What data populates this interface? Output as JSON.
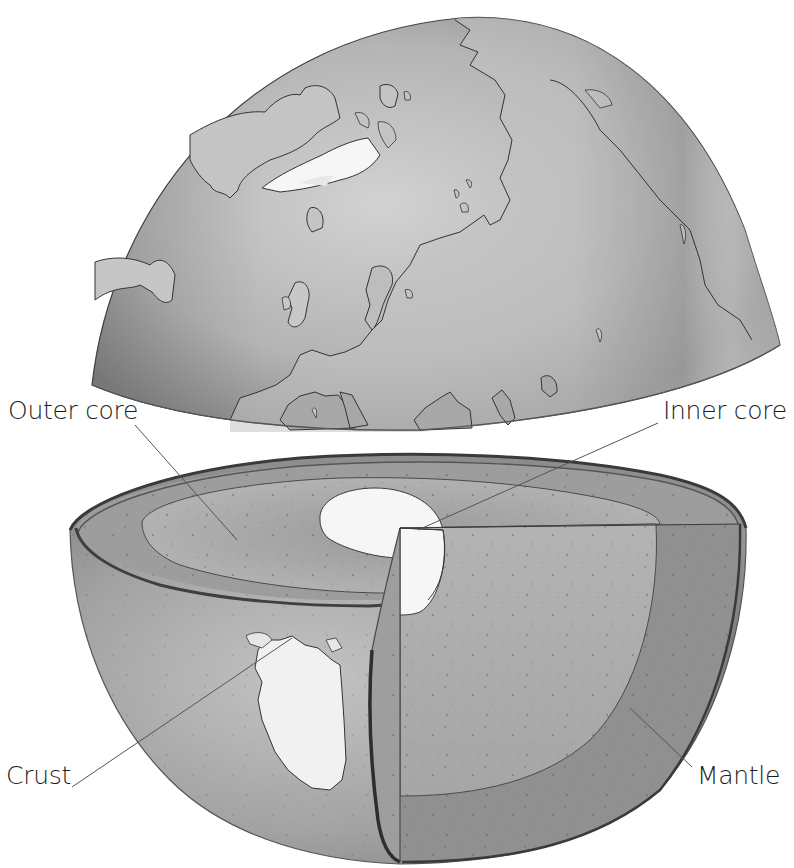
{
  "diagram": {
    "title_fragment": "",
    "colors": {
      "background": "#ffffff",
      "ocean": "#9a9a9a",
      "land": "#c9c9c9",
      "ice": "#f4f4f4",
      "outer_core": "#a8a8a8",
      "inner_core": "#f7f7f7",
      "mantle": "#8d8d8d",
      "crust": "#5a5a5a",
      "outline": "#333333",
      "leader_line": "#555555",
      "label_text": "#1c1c1c"
    },
    "components": [
      {
        "id": "upper-hemisphere",
        "description": "Northern hemisphere dome lifted off, showing Greenland, Europe, Scandinavia and Arctic landmasses"
      },
      {
        "id": "lower-hemisphere",
        "description": "Southern half cut open showing layered interior and Africa on the exterior"
      }
    ],
    "labels": [
      {
        "id": "outer-core",
        "text": "Outer core",
        "x": 8,
        "y": 398,
        "line": {
          "x1": 135,
          "y1": 425,
          "x2": 237,
          "y2": 540
        }
      },
      {
        "id": "inner-core",
        "text": "Inner core",
        "x": 663,
        "y": 398,
        "line": {
          "x1": 658,
          "y1": 423,
          "x2": 418,
          "y2": 530
        }
      },
      {
        "id": "crust",
        "text": "Crust",
        "x": 6,
        "y": 763,
        "line": {
          "x1": 72,
          "y1": 787,
          "x2": 292,
          "y2": 638
        }
      },
      {
        "id": "mantle",
        "text": "Mantle",
        "x": 697,
        "y": 763,
        "line": {
          "x1": 692,
          "y1": 767,
          "x2": 630,
          "y2": 708
        }
      }
    ]
  }
}
